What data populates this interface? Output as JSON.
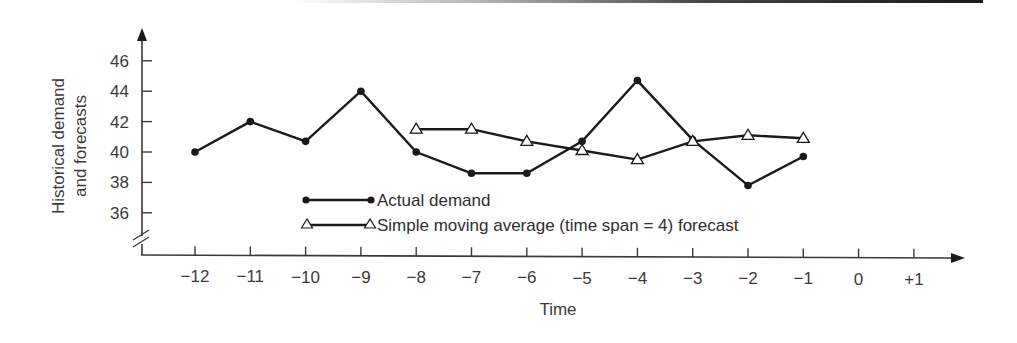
{
  "chart_data": {
    "type": "line",
    "title": "",
    "xlabel": "Time",
    "ylabel": [
      "Historical demand",
      "and forecasts"
    ],
    "x_ticks": [
      "−12",
      "−11",
      "−10",
      "−9",
      "−8",
      "−7",
      "−6",
      "−5",
      "−4",
      "−3",
      "−2",
      "−1",
      "0",
      "+1"
    ],
    "x_values": [
      -12,
      -11,
      -10,
      -9,
      -8,
      -7,
      -6,
      -5,
      -4,
      -3,
      -2,
      -1,
      0,
      1
    ],
    "y_ticks": [
      46,
      44,
      42,
      40,
      38,
      36
    ],
    "ylim": [
      35,
      47
    ],
    "y_axis_break": true,
    "grid": false,
    "legend_position": "inside-bottom-center",
    "series": [
      {
        "name": "Actual demand",
        "marker": "filled-circle",
        "x": [
          -12,
          -11,
          -10,
          -9,
          -8,
          -7,
          -6,
          -5,
          -4,
          -3,
          -2,
          -1
        ],
        "values": [
          40,
          42,
          40.7,
          44,
          40,
          38.6,
          38.6,
          40.7,
          44.7,
          40.8,
          37.8,
          39.7
        ]
      },
      {
        "name": "Simple moving average (time span = 4) forecast",
        "marker": "open-triangle",
        "x": [
          -8,
          -7,
          -6,
          -5,
          -4,
          -3,
          -2,
          -1
        ],
        "values": [
          41.5,
          41.5,
          40.7,
          40.1,
          39.5,
          40.7,
          41.1,
          40.9
        ]
      }
    ]
  },
  "legend": {
    "actual_label": "Actual demand",
    "forecast_label": "Simple moving average (time span = 4) forecast"
  },
  "axes": {
    "x_title": "Time",
    "y_title_line1": "Historical demand",
    "y_title_line2": "and forecasts"
  },
  "colors": {
    "line": "#1a1a1a",
    "axis": "#3a3a3a"
  }
}
